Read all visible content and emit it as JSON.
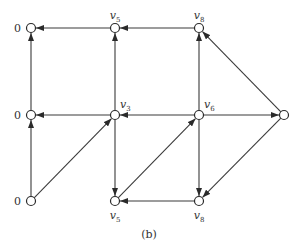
{
  "diagram": {
    "caption": "(b)",
    "nodes": [
      {
        "id": "tl",
        "x": 31,
        "y": 28,
        "label": "0",
        "label_pos": "left"
      },
      {
        "id": "tm",
        "x": 115,
        "y": 28,
        "label": "v",
        "sub": "5",
        "label_pos": "above"
      },
      {
        "id": "tr",
        "x": 199,
        "y": 28,
        "label": "v",
        "sub": "8",
        "label_pos": "above"
      },
      {
        "id": "ml",
        "x": 31,
        "y": 115,
        "label": "0",
        "label_pos": "left"
      },
      {
        "id": "mm",
        "x": 115,
        "y": 115,
        "label": "v",
        "sub": "3",
        "label_pos": "above-right"
      },
      {
        "id": "mr",
        "x": 199,
        "y": 115,
        "label": "v",
        "sub": "6",
        "label_pos": "above-right"
      },
      {
        "id": "fr",
        "x": 284,
        "y": 115,
        "label": "",
        "label_pos": "none"
      },
      {
        "id": "bl",
        "x": 31,
        "y": 201,
        "label": "0",
        "label_pos": "left"
      },
      {
        "id": "bm",
        "x": 115,
        "y": 201,
        "label": "v",
        "sub": "5",
        "label_pos": "below"
      },
      {
        "id": "br",
        "x": 199,
        "y": 201,
        "label": "v",
        "sub": "8",
        "label_pos": "below"
      }
    ],
    "edges": [
      {
        "from": "tm",
        "to": "tl"
      },
      {
        "from": "tr",
        "to": "tm"
      },
      {
        "from": "ml",
        "to": "tl"
      },
      {
        "from": "mm",
        "to": "tm"
      },
      {
        "from": "mr",
        "to": "tr"
      },
      {
        "from": "fr",
        "to": "tr"
      },
      {
        "from": "mm",
        "to": "ml"
      },
      {
        "from": "mr",
        "to": "mm"
      },
      {
        "from": "mr",
        "to": "fr"
      },
      {
        "from": "bl",
        "to": "ml"
      },
      {
        "from": "bl",
        "to": "mm"
      },
      {
        "from": "mm",
        "to": "bm"
      },
      {
        "from": "bm",
        "to": "mr"
      },
      {
        "from": "mr",
        "to": "br"
      },
      {
        "from": "fr",
        "to": "br"
      },
      {
        "from": "br",
        "to": "bm"
      }
    ]
  }
}
